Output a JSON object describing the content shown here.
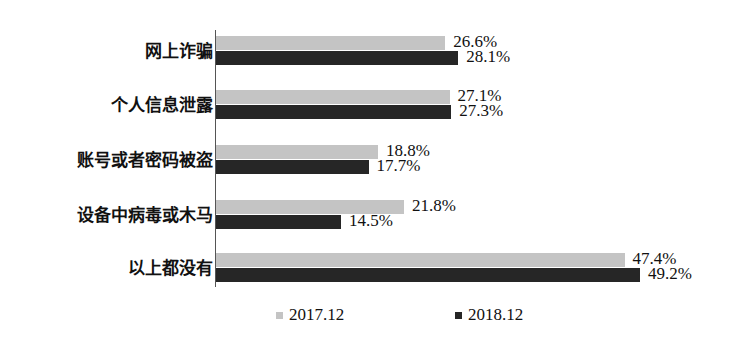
{
  "chart_data": {
    "type": "bar",
    "orientation": "horizontal",
    "title": "",
    "xlabel": "",
    "ylabel": "",
    "categories": [
      "网上诈骗",
      "个人信息泄露",
      "账号或者密码被盗",
      "设备中病毒或木马",
      "以上都没有"
    ],
    "series": [
      {
        "name": "2017.12",
        "color": "#c4c4c4",
        "values": [
          26.6,
          27.1,
          18.8,
          21.8,
          47.4
        ],
        "labels": [
          "26.6%",
          "27.1%",
          "18.8%",
          "21.8%",
          "47.4%"
        ]
      },
      {
        "name": "2018.12",
        "color": "#262626",
        "values": [
          28.1,
          27.3,
          17.7,
          14.5,
          49.2
        ],
        "labels": [
          "28.1%",
          "27.3%",
          "17.7%",
          "14.5%",
          "49.2%"
        ]
      }
    ],
    "xlim": [
      0,
      50
    ],
    "grid": false,
    "legend_position": "bottom"
  },
  "legend": [
    {
      "label": "2017.12",
      "color": "#c4c4c4"
    },
    {
      "label": "2018.12",
      "color": "#262626"
    }
  ]
}
